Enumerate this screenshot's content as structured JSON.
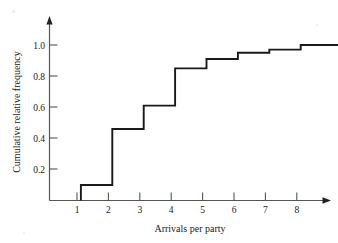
{
  "chart_data": {
    "type": "line",
    "subtype": "step-post cumulative relative frequency (empirical CDF)",
    "title": "",
    "xlabel": "Arrivals per party",
    "ylabel": "Cumulative relative frequency",
    "x": [
      1,
      2,
      3,
      4,
      5,
      6,
      7,
      8
    ],
    "values": [
      0.1,
      0.46,
      0.61,
      0.85,
      0.91,
      0.95,
      0.97,
      1.0
    ],
    "series": [
      {
        "name": "Cumulative relative frequency",
        "values": [
          0.1,
          0.46,
          0.61,
          0.85,
          0.91,
          0.95,
          0.97,
          1.0
        ]
      }
    ],
    "xlim": [
      0,
      9.2
    ],
    "ylim": [
      0,
      1.12
    ],
    "xticks": [
      1,
      2,
      3,
      4,
      5,
      6,
      7,
      8
    ],
    "xtick_labels": [
      "1",
      "2",
      "3",
      "4",
      "5",
      "6",
      "7",
      "8"
    ],
    "yticks": [
      0.2,
      0.4,
      0.6,
      0.8,
      1.0
    ],
    "ytick_labels": [
      "0.2",
      "0.4",
      "0.6",
      "0.8",
      "1.0"
    ],
    "grid": false,
    "legend": null,
    "legend_position": "none",
    "annotations": [],
    "line_color": "#1a1a1a",
    "axis_color": "#555555",
    "background_color": "#ffffff",
    "steps": [
      {
        "from_x": 1,
        "to_x": 2,
        "level": 0.1
      },
      {
        "from_x": 2,
        "to_x": 3,
        "level": 0.46
      },
      {
        "from_x": 3,
        "to_x": 4,
        "level": 0.61
      },
      {
        "from_x": 4,
        "to_x": 5,
        "level": 0.85
      },
      {
        "from_x": 5,
        "to_x": 6,
        "level": 0.91
      },
      {
        "from_x": 6,
        "to_x": 7,
        "level": 0.95
      },
      {
        "from_x": 7,
        "to_x": 8,
        "level": 0.97
      },
      {
        "from_x": 8,
        "to_x": 9.2,
        "level": 1.0
      }
    ]
  },
  "axes": {
    "x_axis_title": "Arrivals per party",
    "y_axis_title": "Cumulative relative frequency",
    "x_tick_labels": [
      "1",
      "2",
      "3",
      "4",
      "5",
      "6",
      "7",
      "8"
    ],
    "y_tick_labels": [
      "0.2",
      "0.4",
      "0.6",
      "0.8",
      "1.0"
    ]
  }
}
